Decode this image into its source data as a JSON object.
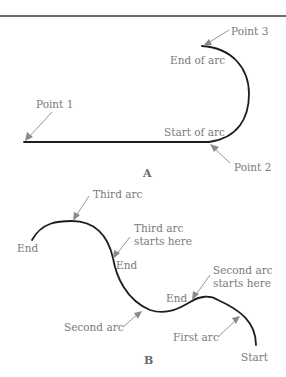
{
  "diagram_a": {
    "caption": "A",
    "labels": {
      "point1": "Point 1",
      "point2": "Point 2",
      "point3": "Point 3",
      "start_of_arc": "Start of arc",
      "end_of_arc": "End of arc"
    }
  },
  "diagram_b": {
    "caption": "B",
    "labels": {
      "third_arc": "Third arc",
      "third_arc_starts_line1": "Third arc",
      "third_arc_starts_line2": "starts here",
      "end_left": "End",
      "end_middle": "End",
      "second_arc_starts_line1": "Second arc",
      "second_arc_starts_line2": "starts here",
      "end_right": "End",
      "second_arc": "Second arc",
      "first_arc": "First arc",
      "start": "Start"
    }
  },
  "colors": {
    "line": "#1e1e1e",
    "label": "#7a7a7a",
    "leader": "#8a8a8a"
  }
}
